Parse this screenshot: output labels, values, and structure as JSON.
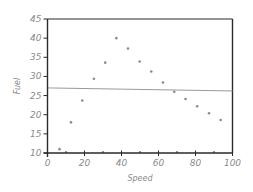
{
  "chart_data": {
    "type": "scatter",
    "title": "",
    "xlabel": "Speed",
    "ylabel": "Fuel",
    "xlim": [
      0,
      100
    ],
    "ylim": [
      10,
      45
    ],
    "xticks": [
      0,
      20,
      40,
      60,
      80,
      100
    ],
    "xminor_ticks": [
      10,
      30,
      50,
      70,
      90
    ],
    "yticks": [
      10,
      15,
      20,
      25,
      30,
      35,
      40,
      45
    ],
    "grid": false,
    "legend": null,
    "series": [
      {
        "name": "observations",
        "marker": "dot",
        "color": "#8c8c8c",
        "x": [
          6.5,
          12.7,
          18.8,
          25.1,
          31.2,
          37.2,
          43.5,
          49.8,
          56.1,
          62.4,
          68.5,
          74.6,
          80.9,
          87.3,
          93.6
        ],
        "y": [
          11.0,
          18.0,
          23.7,
          29.4,
          33.6,
          40.0,
          37.3,
          33.9,
          31.3,
          28.4,
          26.0,
          24.1,
          22.2,
          20.4,
          18.6
        ]
      },
      {
        "name": "linear fit",
        "type": "line",
        "color": "#9a9a9a",
        "x": [
          0,
          100
        ],
        "y": [
          27.0,
          26.2
        ]
      }
    ]
  },
  "colors": {
    "axis": "#2a2a2a",
    "frame": "#2a2a2a",
    "points": "#8c8c8c",
    "fit_line": "#9a9a9a",
    "text": "#8a8a8a"
  }
}
